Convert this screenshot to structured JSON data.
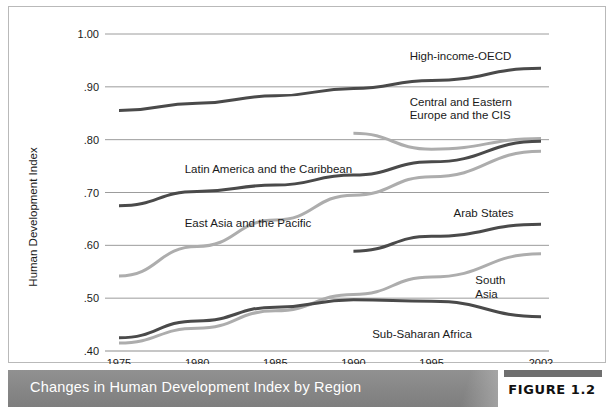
{
  "figure": {
    "caption": "Changes in Human Development Index by Region",
    "number_label": "FIGURE 1.2"
  },
  "chart_data": {
    "type": "line",
    "title": "Changes in Human Development Index by Region",
    "xlabel": "",
    "ylabel": "Human Development Index",
    "x": [
      1975,
      1980,
      1985,
      1990,
      1995,
      2002
    ],
    "xtick_labels": [
      "1975",
      "1980",
      "1985",
      "1990",
      "1995",
      "2002"
    ],
    "ytick_labels": [
      "1.00",
      ".90",
      ".80",
      ".70",
      ".60",
      ".50",
      ".40"
    ],
    "yticks": [
      1.0,
      0.9,
      0.8,
      0.7,
      0.6,
      0.5,
      0.4
    ],
    "ylim": [
      0.4,
      1.0
    ],
    "xlim": [
      1975,
      2002
    ],
    "grid": "horizontal",
    "legend": "inline-labels",
    "series": [
      {
        "name": "High-income-OECD",
        "color": "#4a4a4a",
        "width": 3.0,
        "x": [
          1975,
          1980,
          1985,
          1990,
          1995,
          2002
        ],
        "values": [
          0.855,
          0.869,
          0.883,
          0.897,
          0.912,
          0.935
        ]
      },
      {
        "name": "Central and Eastern Europe and the CIS",
        "color": "#adadad",
        "width": 3.0,
        "x": [
          1990,
          1995,
          2002
        ],
        "values": [
          0.812,
          0.782,
          0.802
        ]
      },
      {
        "name": "Latin America and the Caribbean",
        "color": "#4a4a4a",
        "width": 3.0,
        "x": [
          1975,
          1980,
          1985,
          1990,
          1995,
          2002
        ],
        "values": [
          0.675,
          0.702,
          0.714,
          0.733,
          0.758,
          0.797
        ]
      },
      {
        "name": "East Asia and the Pacific",
        "color": "#adadad",
        "width": 3.0,
        "x": [
          1975,
          1980,
          1985,
          1990,
          1995,
          2002
        ],
        "values": [
          0.542,
          0.598,
          0.648,
          0.695,
          0.73,
          0.778
        ]
      },
      {
        "name": "Arab States",
        "color": "#4a4a4a",
        "width": 3.0,
        "x": [
          1990,
          1995,
          2002
        ],
        "values": [
          0.589,
          0.617,
          0.64
        ]
      },
      {
        "name": "South Asia",
        "color": "#adadad",
        "width": 3.0,
        "x": [
          1975,
          1980,
          1985,
          1990,
          1995,
          2002
        ],
        "values": [
          0.415,
          0.443,
          0.476,
          0.507,
          0.54,
          0.584
        ]
      },
      {
        "name": "Sub-Saharan Africa",
        "color": "#4a4a4a",
        "width": 3.0,
        "x": [
          1975,
          1980,
          1985,
          1990,
          1995,
          2002
        ],
        "values": [
          0.425,
          0.457,
          0.483,
          0.497,
          0.494,
          0.465
        ]
      }
    ],
    "annotations": [
      {
        "text": "High-income-OECD",
        "x": 1993.6,
        "y": 0.958,
        "anchor": "start"
      },
      {
        "text": "Central and Eastern",
        "x": 1993.6,
        "y": 0.872,
        "anchor": "start"
      },
      {
        "text": "Europe and the CIS",
        "x": 1993.6,
        "y": 0.846,
        "anchor": "start"
      },
      {
        "text": "Latin America and the Caribbean",
        "x": 1979.2,
        "y": 0.744,
        "anchor": "start"
      },
      {
        "text": "East Asia and the Pacific",
        "x": 1979.2,
        "y": 0.642,
        "anchor": "start"
      },
      {
        "text": "Arab States",
        "x": 1996.4,
        "y": 0.662,
        "anchor": "start"
      },
      {
        "text": "South",
        "x": 1997.8,
        "y": 0.534,
        "anchor": "start"
      },
      {
        "text": "Asia",
        "x": 1997.8,
        "y": 0.508,
        "anchor": "start"
      },
      {
        "text": "Sub-Saharan Africa",
        "x": 1991.2,
        "y": 0.432,
        "anchor": "start"
      }
    ]
  }
}
